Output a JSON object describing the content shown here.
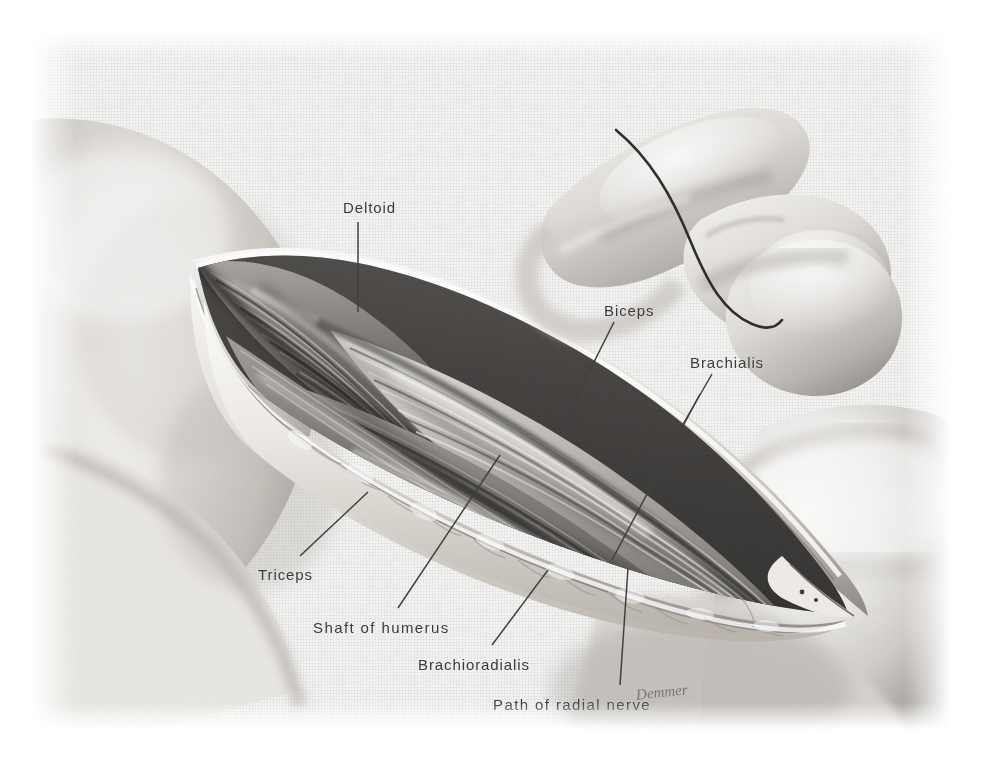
{
  "plate": {
    "title": "Anterolateral approach to the shaft of the humerus",
    "background_color": "#ffffff",
    "field_color": "#f6f6f5",
    "ink_color": "#3a3a3a"
  },
  "labels": [
    {
      "id": "deltoid",
      "text": "Deltoid",
      "x": 343,
      "y": 200
    },
    {
      "id": "biceps",
      "text": "Biceps",
      "x": 604,
      "y": 303
    },
    {
      "id": "brachialis",
      "text": "Brachialis",
      "x": 690,
      "y": 355
    },
    {
      "id": "triceps",
      "text": "Triceps",
      "x": 258,
      "y": 567
    },
    {
      "id": "shaft-of-humerus",
      "text": "Shaft of humerus",
      "x": 313,
      "y": 620
    },
    {
      "id": "brachioradialis",
      "text": "Brachioradialis",
      "x": 418,
      "y": 657
    },
    {
      "id": "path-of-radial-nerve",
      "text": "Path of radial nerve",
      "x": 493,
      "y": 697
    }
  ],
  "leaders": [
    {
      "id": "leader-deltoid",
      "x1": 358,
      "y1": 222,
      "x2": 358,
      "y2": 312
    },
    {
      "id": "leader-biceps",
      "x1": 614,
      "y1": 322,
      "x2": 560,
      "y2": 430
    },
    {
      "id": "leader-brachialis",
      "x1": 712,
      "y1": 374,
      "x2": 644,
      "y2": 492
    },
    {
      "id": "leader-brachialis-lower",
      "x1": 700,
      "y1": 394,
      "x2": 612,
      "y2": 560
    },
    {
      "id": "leader-triceps",
      "x1": 300,
      "y1": 556,
      "x2": 368,
      "y2": 492
    },
    {
      "id": "leader-shaft-of-humerus",
      "x1": 398,
      "y1": 608,
      "x2": 500,
      "y2": 455
    },
    {
      "id": "leader-brachioradialis",
      "x1": 492,
      "y1": 645,
      "x2": 548,
      "y2": 570
    },
    {
      "id": "leader-path-of-radial-nerve",
      "x1": 620,
      "y1": 685,
      "x2": 628,
      "y2": 568
    }
  ],
  "inset": {
    "id": "arm-inset-flexed-elbow",
    "description": "Flexed arm viewed from the lateral side with the skin incision marked",
    "incision_line": "curved anterolateral incision from deltoid to the antecubital fossa"
  },
  "main_view": {
    "id": "surgical-exposure",
    "description": "Anterolateral exposure of the humeral shaft; skin and fascia retracted showing deltoid, biceps, brachialis, triceps, brachioradialis and the path of the radial nerve"
  },
  "signature": {
    "text": "Demmer",
    "x": 636,
    "y": 686
  }
}
